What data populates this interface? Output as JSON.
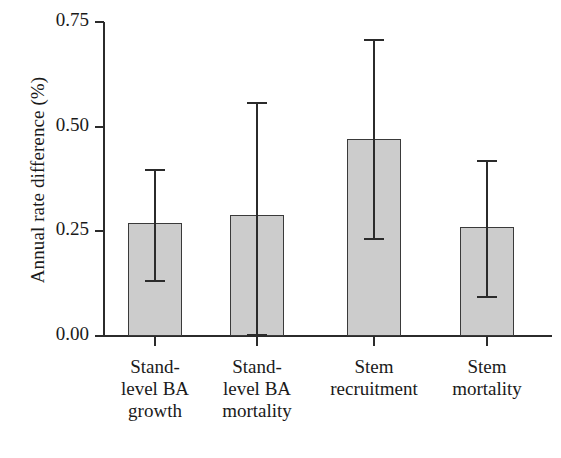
{
  "chart_data": {
    "type": "bar",
    "title": "",
    "xlabel": "",
    "ylabel": "Annual rate difference (%)",
    "ylim": [
      0.0,
      0.75
    ],
    "ytick_labels": [
      "0.00",
      "0.25",
      "0.50",
      "0.75"
    ],
    "ytick_values": [
      0.0,
      0.25,
      0.5,
      0.75
    ],
    "grid": false,
    "legend": "none",
    "error_bar_style": "capped-vertical",
    "bar_color": "#cccccc",
    "bar_edge_color": "#3a3a3a",
    "axis_color": "#2b2b2b",
    "categories": [
      "Stand-\nlevel BA\ngrowth",
      "Stand-\nlevel BA\nmortality",
      "Stem\nrecruitment",
      "Stem\nmortality"
    ],
    "values": [
      0.27,
      0.29,
      0.47,
      0.26
    ],
    "error_high": [
      0.4,
      0.56,
      0.71,
      0.42
    ],
    "error_low": [
      0.13,
      0.0,
      0.23,
      0.09
    ]
  },
  "axis": {
    "y_title": "Annual rate difference (%)"
  }
}
